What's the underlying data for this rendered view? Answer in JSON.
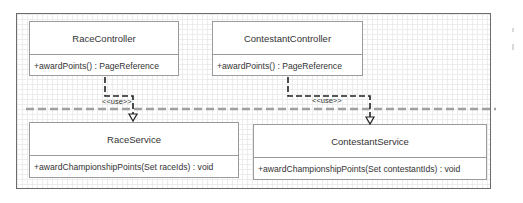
{
  "diagram": {
    "type": "UML class diagram",
    "classes": [
      {
        "id": "race-controller",
        "name": "RaceController",
        "operations": [
          "+awardPoints() : PageReference"
        ]
      },
      {
        "id": "contestant-controller",
        "name": "ContestantController",
        "operations": [
          "+awardPoints() : PageReference"
        ]
      },
      {
        "id": "race-service",
        "name": "RaceService",
        "operations": [
          "+awardChampionshipPoints(Set raceIds) : void"
        ]
      },
      {
        "id": "contestant-service",
        "name": "ContestantService",
        "operations": [
          "+awardChampionshipPoints(Set contestantIds) : void"
        ]
      }
    ],
    "dependencies": [
      {
        "from": "RaceController",
        "to": "RaceService",
        "stereotype": "<<use>>"
      },
      {
        "from": "ContestantController",
        "to": "ContestantService",
        "stereotype": "<<use>>"
      }
    ],
    "layer_separator": {
      "style": "dashed",
      "color": "#9a9a9a"
    }
  },
  "colors": {
    "box_border": "#9a9a9a",
    "frame_border": "#6b6b6b",
    "connector": "#222222",
    "separator": "#a0a0a0",
    "grid": "#ececec"
  }
}
